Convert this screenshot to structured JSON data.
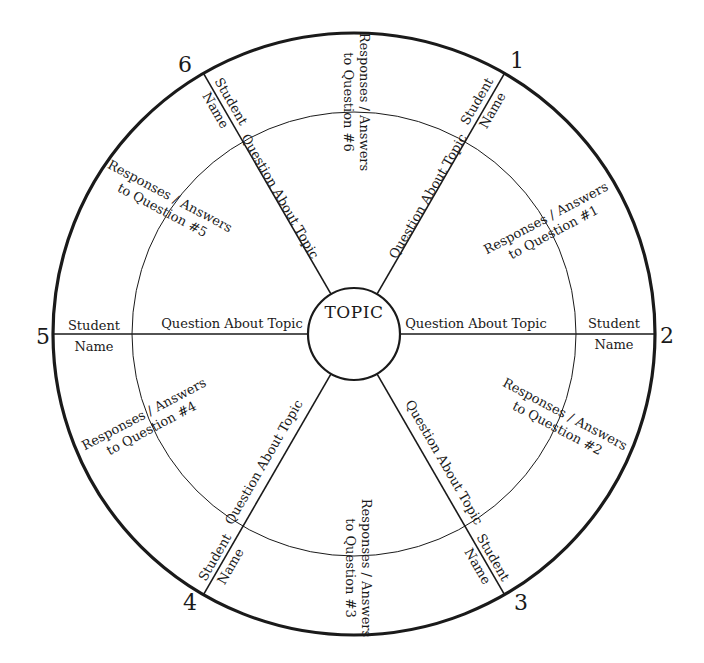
{
  "diagram": {
    "center_label": "TOPIC",
    "spoke_inner_label": "Question About Topic",
    "student_label_line1": "Student",
    "student_label_line2": "Name",
    "sections": [
      {
        "number": "1",
        "responses_line1": "Responses / Answers",
        "responses_line2": "to Question #1"
      },
      {
        "number": "2",
        "responses_line1": "Responses / Answers",
        "responses_line2": "to Question #2"
      },
      {
        "number": "3",
        "responses_line1": "Responses / Answers",
        "responses_line2": "to Question #3"
      },
      {
        "number": "4",
        "responses_line1": "Responses / Answers",
        "responses_line2": "to Question #4"
      },
      {
        "number": "5",
        "responses_line1": "Responses / Answers",
        "responses_line2": "to Question #5"
      },
      {
        "number": "6",
        "responses_line1": "Responses / Answers",
        "responses_line2": "to Question #6"
      }
    ],
    "colors": {
      "line": "#1a1a1a",
      "background": "#ffffff"
    }
  }
}
